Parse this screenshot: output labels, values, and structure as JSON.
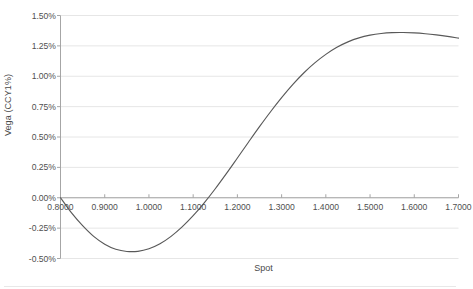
{
  "chart_data": {
    "type": "line",
    "title": "",
    "xlabel": "Spot",
    "ylabel": "Vega (CCY1%)",
    "xlim": [
      0.8,
      1.7
    ],
    "ylim": [
      -0.005,
      0.015
    ],
    "grid": true,
    "legend": false,
    "legend_position": "none",
    "line_color": "#595959",
    "gridline_color": "#e6e6e6",
    "axis_color": "#a6a6a6",
    "x_tick_labels": [
      "0.8000",
      "0.9000",
      "1.0000",
      "1.1000",
      "1.2000",
      "1.3000",
      "1.4000",
      "1.5000",
      "1.6000",
      "1.7000"
    ],
    "x_tick_values": [
      0.8,
      0.9,
      1.0,
      1.1,
      1.2,
      1.3,
      1.4,
      1.5,
      1.6,
      1.7
    ],
    "y_tick_labels": [
      "1.50%",
      "1.25%",
      "1.00%",
      "0.75%",
      "0.50%",
      "0.25%",
      "0.00%",
      "-0.25%",
      "-0.50%"
    ],
    "y_tick_values": [
      0.015,
      0.0125,
      0.01,
      0.0075,
      0.005,
      0.0025,
      0.0,
      -0.0025,
      -0.005
    ],
    "series": [
      {
        "name": "Vega",
        "x": [
          0.8,
          0.825,
          0.85,
          0.875,
          0.9,
          0.925,
          0.95,
          0.975,
          1.0,
          1.025,
          1.05,
          1.075,
          1.1,
          1.125,
          1.15,
          1.175,
          1.2,
          1.225,
          1.25,
          1.275,
          1.3,
          1.325,
          1.35,
          1.375,
          1.4,
          1.425,
          1.45,
          1.475,
          1.5,
          1.525,
          1.55,
          1.575,
          1.6,
          1.625,
          1.65,
          1.675,
          1.7
        ],
        "y": [
          0.0,
          -0.00125,
          -0.0023,
          -0.00318,
          -0.00382,
          -0.00424,
          -0.00442,
          -0.00441,
          -0.0042,
          -0.00379,
          -0.00318,
          -0.0024,
          -0.00148,
          -0.00042,
          0.00074,
          0.00198,
          0.00327,
          0.00457,
          0.00585,
          0.00708,
          0.00824,
          0.00931,
          0.01027,
          0.0111,
          0.0118,
          0.01238,
          0.01283,
          0.01316,
          0.01338,
          0.01352,
          0.01359,
          0.0136,
          0.01357,
          0.0135,
          0.0134,
          0.01328,
          0.01314
        ]
      }
    ],
    "annotations": {
      "minimum": {
        "x": 0.975,
        "y": -0.00442
      },
      "zero_crossing": {
        "x": 1.159,
        "y": 0.0
      },
      "peak": {
        "x": 1.578,
        "y": 0.0136
      }
    }
  }
}
